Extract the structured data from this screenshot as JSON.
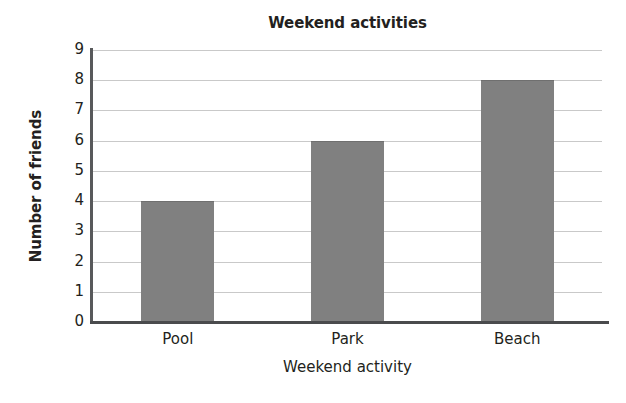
{
  "chart_data": {
    "type": "bar",
    "title": "Weekend activities",
    "xlabel": "Weekend activity",
    "ylabel": "Number of friends",
    "categories": [
      "Pool",
      "Park",
      "Beach"
    ],
    "values": [
      4,
      6,
      8
    ],
    "ylim": [
      0,
      9
    ],
    "ytick_labels": [
      "0",
      "1",
      "2",
      "3",
      "4",
      "5",
      "6",
      "7",
      "8",
      "9"
    ],
    "ytick_values": [
      0,
      1,
      2,
      3,
      4,
      5,
      6,
      7,
      8,
      9
    ],
    "grid": true,
    "legend": null,
    "colors": {
      "bar_fill": "#808080",
      "gridline": "#c9c9c9",
      "axis": "#4a4b4d",
      "text": "#231f20",
      "background": "#ffffff"
    }
  }
}
